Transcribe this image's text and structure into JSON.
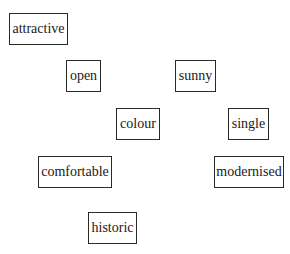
{
  "words": [
    {
      "id": "attractive",
      "label": "attractive"
    },
    {
      "id": "open",
      "label": "open"
    },
    {
      "id": "sunny",
      "label": "sunny"
    },
    {
      "id": "colour",
      "label": "colour"
    },
    {
      "id": "single",
      "label": "single"
    },
    {
      "id": "comfortable",
      "label": "comfortable"
    },
    {
      "id": "modernised",
      "label": "modernised"
    },
    {
      "id": "historic",
      "label": "historic"
    }
  ]
}
